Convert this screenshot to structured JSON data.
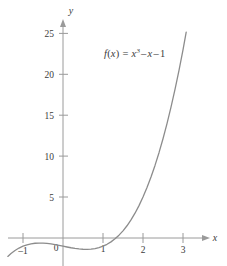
{
  "chart_data": {
    "type": "line",
    "title": "",
    "subtitle": "",
    "xlabel": "x",
    "ylabel": "y",
    "xlim": [
      -1.38,
      3.6
    ],
    "ylim": [
      -3.4,
      28.0
    ],
    "grid": false,
    "legend_position": "none",
    "annotations": [
      {
        "name": "function-equation",
        "text": "f(x) = x³ − x − 1",
        "parts": {
          "fname": "f",
          "arg_open": "(",
          "arg": "x",
          "arg_close": ")",
          "equals": "=",
          "term1_base": "x",
          "term1_exp": "3",
          "minus1": "–",
          "term2": "x",
          "minus2": "–",
          "term3": "1"
        },
        "x_data": 1.15,
        "y_data": 22.5
      }
    ],
    "xticks": [
      {
        "value": -1,
        "label": "–1"
      },
      {
        "value": 0,
        "label": "0"
      },
      {
        "value": 1,
        "label": "1"
      },
      {
        "value": 2,
        "label": "2"
      },
      {
        "value": 3,
        "label": "3"
      }
    ],
    "yticks": [
      {
        "value": 5,
        "label": "5"
      },
      {
        "value": 10,
        "label": "10"
      },
      {
        "value": 15,
        "label": "15"
      },
      {
        "value": 20,
        "label": "20"
      },
      {
        "value": 25,
        "label": "25"
      }
    ],
    "series": [
      {
        "name": "f(x) = x^3 - x - 1",
        "expression": "x^3 - x - 1",
        "color": "#8c8c8c",
        "linewidth": 1.3,
        "x": [
          -1.38,
          -1.3,
          -1.2,
          -1.1,
          -1.0,
          -0.9,
          -0.8,
          -0.7,
          -0.6,
          -0.5,
          -0.4,
          -0.3,
          -0.2,
          -0.1,
          0.0,
          0.1,
          0.2,
          0.3,
          0.4,
          0.5,
          0.6,
          0.7,
          0.8,
          0.9,
          1.0,
          1.1,
          1.2,
          1.3,
          1.4,
          1.5,
          1.6,
          1.7,
          1.8,
          1.9,
          2.0,
          2.1,
          2.2,
          2.3,
          2.4,
          2.5,
          2.6,
          2.7,
          2.8,
          2.9,
          3.0,
          3.08
        ],
        "y": [
          -2.25,
          -1.897,
          -1.528,
          -1.231,
          -1.0,
          -0.829,
          -0.712,
          -0.643,
          -0.616,
          -0.625,
          -0.664,
          -0.727,
          -0.808,
          -0.901,
          -1.0,
          -1.099,
          -1.192,
          -1.273,
          -1.336,
          -1.375,
          -1.384,
          -1.357,
          -1.288,
          -1.171,
          -1.0,
          -0.769,
          -0.472,
          -0.103,
          0.344,
          0.875,
          1.496,
          2.213,
          3.032,
          3.959,
          5.0,
          6.161,
          7.448,
          8.867,
          10.424,
          12.125,
          13.976,
          15.983,
          18.152,
          20.489,
          23.0,
          25.15
        ]
      }
    ]
  },
  "axes": {
    "x_axis_name": "x",
    "y_axis_name": "y",
    "axis_color": "#9a9a9a",
    "tick_color": "#7a7a7a",
    "text_color": "#3b3b3b"
  }
}
